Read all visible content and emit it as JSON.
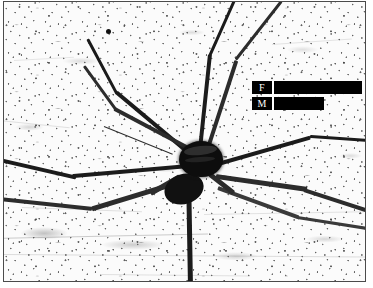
{
  "figure": {
    "kind": "photograph",
    "caption_text": "",
    "border_color": "#4b4b4b",
    "background_color": "#fbfbfb",
    "ink_color": "#111111"
  },
  "annotations": {
    "scale_bars": [
      {
        "id": "scale-bar-female",
        "label": "F",
        "label_meaning": "female",
        "bar_color": "#000000",
        "label_text_color": "#ffffff",
        "left_px": 248,
        "top_px": 79,
        "total_width_px": 110,
        "relative_length": 1.0
      },
      {
        "id": "scale-bar-male",
        "label": "M",
        "label_meaning": "male",
        "bar_color": "#000000",
        "label_text_color": "#ffffff",
        "left_px": 248,
        "top_px": 95,
        "total_width_px": 72,
        "relative_length": 0.65
      }
    ],
    "pointer": {
      "id": "leader-line",
      "description": "thin diagonal leader line pointing toward the spider's left legs",
      "start_x_px": 100,
      "start_y_px": 124,
      "end_x_px": 168,
      "end_y_px": 152,
      "color": "#2a2a2a"
    },
    "marker_dot": {
      "id": "leg-marker-dot",
      "description": "small dark blob on the upper-left leg",
      "x_px": 104,
      "y_px": 29,
      "diameter_px": 5,
      "color": "#101010"
    }
  },
  "subject": {
    "body": {
      "cephalothorax": {
        "center_x_px": 196,
        "center_y_px": 156,
        "width_px": 40,
        "height_px": 32
      },
      "abdomen": {
        "center_x_px": 178,
        "center_y_px": 188,
        "width_px": 34,
        "height_px": 26
      }
    },
    "legs": [
      {
        "name": "leg-front-left",
        "angle_deg": -127,
        "length_px": 150,
        "thickness_px": 4
      },
      {
        "name": "leg-second-left",
        "angle_deg": -150,
        "length_px": 120,
        "thickness_px": 4
      },
      {
        "name": "leg-third-left",
        "angle_deg": 175,
        "length_px": 165,
        "thickness_px": 4
      },
      {
        "name": "leg-rear-left",
        "angle_deg": 150,
        "length_px": 130,
        "thickness_px": 4
      },
      {
        "name": "leg-front-right",
        "angle_deg": -78,
        "length_px": 145,
        "thickness_px": 4
      },
      {
        "name": "leg-second-right",
        "angle_deg": -58,
        "length_px": 150,
        "thickness_px": 4
      },
      {
        "name": "leg-third-right",
        "angle_deg": -10,
        "length_px": 165,
        "thickness_px": 4
      },
      {
        "name": "leg-rear-right",
        "angle_deg": 18,
        "length_px": 170,
        "thickness_px": 4
      },
      {
        "name": "leg-rear-downward",
        "angle_deg": 92,
        "length_px": 115,
        "thickness_px": 5
      }
    ]
  }
}
